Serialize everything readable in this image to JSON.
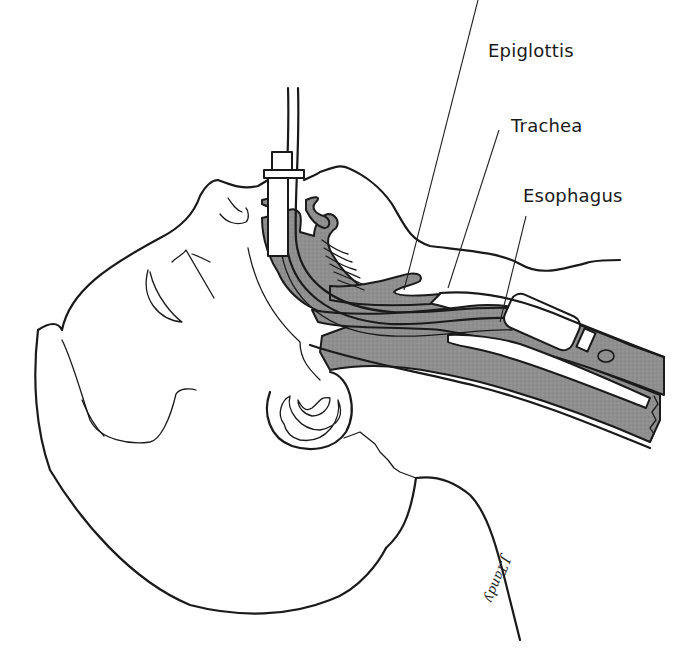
{
  "figure": {
    "labels": [
      {
        "id": "epiglottis",
        "text": "Epiglottis"
      },
      {
        "id": "trachea",
        "text": "Trachea"
      },
      {
        "id": "esophagus",
        "text": "Esophagus"
      }
    ],
    "signature": "J.Tandy",
    "colors": {
      "line": "#1a1a1a",
      "tissue_fill": "#8f8f8f",
      "background": "#ffffff",
      "tube_fill": "#ffffff"
    }
  }
}
